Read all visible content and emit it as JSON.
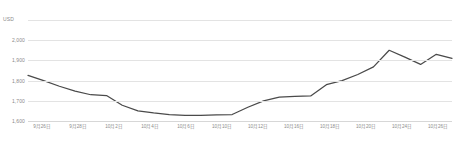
{
  "chart_data": {
    "type": "line",
    "title": "",
    "subtitle": "",
    "xlabel": "",
    "ylabel": "USD",
    "unit_label": "USD",
    "grid": true,
    "legend": false,
    "legend_position": "none",
    "line_color": "#4a4a4a",
    "grid_color": "#e3e3e3",
    "axis_color": "#d7d7d7",
    "label_color": "#8a8a8a",
    "ylim": [
      1600,
      2100
    ],
    "yticks": [
      2000,
      1900,
      1800,
      1700,
      1600
    ],
    "ytick_labels": [
      "2,000",
      "1,900",
      "1,800",
      "1,700",
      "1,600"
    ],
    "ytop_gridline": 2100,
    "xtick_labels": [
      "9月26日",
      "9月28日",
      "10月2日",
      "10月4日",
      "10月6日",
      "10月10日",
      "10月12日",
      "10月16日",
      "10月18日",
      "10月20日",
      "10月24日",
      "10月26日"
    ],
    "x": [
      "9月26日",
      "9月27日",
      "9月28日",
      "9月29日",
      "9月30日",
      "10月2日",
      "10月3日",
      "10月4日",
      "10月5日",
      "10月6日",
      "10月7日",
      "10月9日",
      "10月10日",
      "10月11日",
      "10月12日",
      "10月13日",
      "10月14日",
      "10月16日",
      "10月17日",
      "10月18日",
      "10月19日",
      "10月20日",
      "10月21日",
      "10月23日",
      "10月24日",
      "10月25日",
      "10月26日",
      "10月27日"
    ],
    "series": [
      {
        "name": "USD",
        "values": [
          1826,
          1800,
          1772,
          1748,
          1730,
          1726,
          1678,
          1650,
          1640,
          1632,
          1628,
          1628,
          1630,
          1632,
          1668,
          1700,
          1718,
          1722,
          1724,
          1780,
          1800,
          1830,
          1868,
          1950,
          1916,
          1880,
          1930,
          1910
        ]
      }
    ]
  }
}
